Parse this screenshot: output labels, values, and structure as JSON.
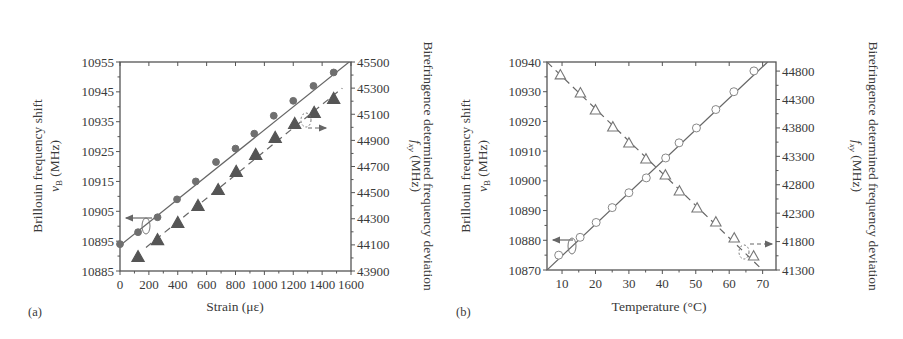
{
  "figure": {
    "panel_a_label": "(a)",
    "panel_b_label": "(b)"
  },
  "chart_data": [
    {
      "panel": "(a)",
      "type": "scatter",
      "title": "",
      "xlabel": "Strain (με)",
      "ylabel": "Brillouin frequency shift ν_B (MHz)",
      "ylabel_line1": "Brillouin frequency shift",
      "ylabel_line2_sym": "v",
      "ylabel_line2_sub": "B",
      "ylabel_line2_unit": " (MHz)",
      "y2label": "Birefringence determined frequency deviation f_xy (MHz)",
      "y2label_line1": "Birefringence determined frequency deviation",
      "y2label_line2_sym": "f",
      "y2label_line2_sub": "xy",
      "y2label_line2_unit": " (MHz)",
      "xlim": [
        0,
        1600
      ],
      "ylim": [
        10885,
        10955
      ],
      "y2lim": [
        43900,
        45500
      ],
      "xticks": [
        0,
        200,
        400,
        600,
        800,
        1000,
        1200,
        1400,
        1600
      ],
      "yticks": [
        10885,
        10895,
        10905,
        10915,
        10925,
        10935,
        10945,
        10955
      ],
      "y2ticks": [
        43900,
        44100,
        44300,
        44500,
        44700,
        44900,
        45100,
        45300,
        45500
      ],
      "grid": false,
      "legend": "arrows: circles → left axis, triangles → right axis",
      "series": [
        {
          "name": "Brillouin frequency shift ν_B",
          "axis": "left",
          "marker": "filled-circle",
          "line": "solid fit",
          "x": [
            0,
            125,
            260,
            395,
            525,
            665,
            800,
            930,
            1065,
            1200,
            1340,
            1480
          ],
          "y": [
            10894,
            10898,
            10903,
            10909,
            10915,
            10921.5,
            10926,
            10931,
            10937,
            10942,
            10947,
            10951.5
          ],
          "fit": {
            "x": [
              0,
              1600
            ],
            "y": [
              10893.5,
              10955.5
            ]
          }
        },
        {
          "name": "Birefringence frequency deviation f_xy",
          "axis": "right",
          "marker": "filled-triangle",
          "line": "dashed fit",
          "x": [
            125,
            260,
            400,
            540,
            680,
            805,
            940,
            1075,
            1210,
            1345,
            1480
          ],
          "y": [
            44007,
            44137,
            44268,
            44398,
            44520,
            44659,
            44789,
            44919,
            45026,
            45111,
            45218
          ],
          "fit": {
            "x": [
              180,
              1540
            ],
            "y": [
              44080,
              45300
            ]
          }
        }
      ]
    },
    {
      "panel": "(b)",
      "type": "scatter",
      "title": "",
      "xlabel": "Temperature (°C)",
      "ylabel": "Brillouin frequency shift ν_B (MHz)",
      "ylabel_line1": "Brillouin frequency shift",
      "ylabel_line2_sym": "v",
      "ylabel_line2_sub": "B",
      "ylabel_line2_unit": " (MHz)",
      "y2label": "Birefringence determined frequency deviation f_xy (MHz)",
      "y2label_line1": "Birefringence determined frequency deviation",
      "y2label_line2_sym": "f",
      "y2label_line2_sub": "xy",
      "y2label_line2_unit": " (MHz)",
      "xlim": [
        5.5,
        74
      ],
      "ylim": [
        10870,
        10940
      ],
      "y2lim": [
        41300,
        44960
      ],
      "xticks": [
        10,
        20,
        30,
        40,
        50,
        60,
        70
      ],
      "yticks": [
        10870,
        10880,
        10890,
        10900,
        10910,
        10920,
        10930,
        10940
      ],
      "y2ticks": [
        41300,
        41800,
        42300,
        42800,
        43300,
        43800,
        44300,
        44800
      ],
      "grid": false,
      "legend": "arrows: circles → left axis, triangles → right axis",
      "series": [
        {
          "name": "Brillouin frequency shift ν_B",
          "axis": "left",
          "marker": "open-circle",
          "line": "solid fit",
          "x": [
            9,
            15.4,
            20.2,
            25,
            30,
            35.2,
            41,
            45,
            50.2,
            56,
            61.4,
            67.4
          ],
          "y": [
            10875,
            10881,
            10886,
            10891,
            10896,
            10901,
            10907.7,
            10912.8,
            10917.8,
            10924,
            10930,
            10937
          ],
          "fit": {
            "x": [
              5.5,
              71.5
            ],
            "y": [
              10870,
              10940
            ]
          }
        },
        {
          "name": "Birefringence frequency deviation f_xy",
          "axis": "right",
          "marker": "open-triangle",
          "line": "dashed fit",
          "x": [
            9.5,
            15.5,
            20,
            25.2,
            30,
            35.1,
            40.9,
            45.1,
            50.4,
            56,
            61.5,
            67.3
          ],
          "y": [
            44730,
            44413,
            44113,
            43814,
            43532,
            43250,
            42968,
            42687,
            42388,
            42141,
            41860,
            41543
          ],
          "fit": {
            "x": [
              5.5,
              70
            ],
            "y": [
              44960,
              41300
            ]
          }
        }
      ]
    }
  ]
}
